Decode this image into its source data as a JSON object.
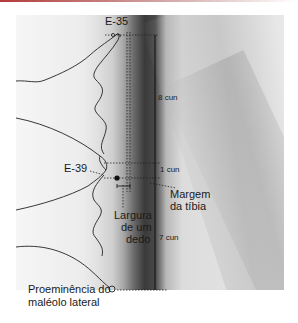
{
  "diagram": {
    "type": "acupuncture point location illustration",
    "points": [
      {
        "id": "E-35",
        "label": "E-35"
      },
      {
        "id": "E-39",
        "label": "E-39"
      }
    ],
    "measurements": {
      "upper_segment": "8 cun",
      "middle_segment": "1 cun",
      "lower_segment": "7 cun"
    },
    "annotations": {
      "tibia_margin_line1": "Margem",
      "tibia_margin_line2": "da tíbia",
      "finger_width_line1": "Largura",
      "finger_width_line2": "de um",
      "finger_width_line3": "dedo",
      "malleolus_line1": "Proeminência do",
      "malleolus_line2": "maléolo lateral"
    },
    "colors": {
      "line": "#1a1a1a",
      "accent_bar": "#b23a3a"
    }
  }
}
